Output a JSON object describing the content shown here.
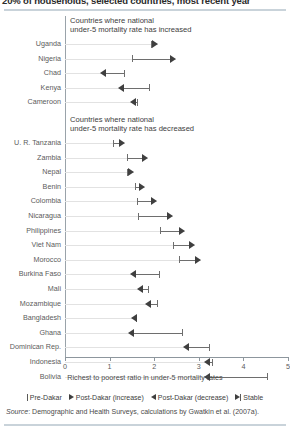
{
  "figure": {
    "title": "20% of households, selected countries, most recent year",
    "x_axis_title": "Richest to poorest ratio in under-5 mortality rates",
    "source_prefix": "Source",
    "source_text": ": Demographic and Health Surveys, calculations by Gwatkin et al. (2007a)."
  },
  "legend": {
    "items": [
      {
        "label": "Pre-Dakar",
        "marker": "vertical-bar"
      },
      {
        "label": "Post-Dakar (increase)",
        "marker": "arrow-right"
      },
      {
        "label": "Post-Dakar (decrease)",
        "marker": "arrow-left"
      },
      {
        "label": "Stable",
        "marker": "arrow-bar"
      }
    ]
  },
  "chart_data": {
    "type": "bar",
    "title": "20% of households, selected countries, most recent year",
    "xlabel": "Richest to poorest ratio in under-5 mortality rates",
    "ylabel": "",
    "xlim": [
      0,
      5
    ],
    "xticks": [
      0,
      1,
      2,
      3,
      4,
      5
    ],
    "grid": false,
    "orientation": "horizontal",
    "legend_position": "bottom",
    "panels": [
      {
        "header": "Countries where national\nunder-5 mortality rate has increased",
        "header_line1": "Countries where national",
        "header_line2": "under-5 mortality rate has increased",
        "rows": [
          {
            "country": "Uganda",
            "pre": 1.92,
            "post": 2.08,
            "direction": "increase"
          },
          {
            "country": "Nigeria",
            "pre": 1.5,
            "post": 2.48,
            "direction": "increase"
          },
          {
            "country": "Chad",
            "pre": 1.32,
            "post": 0.78,
            "direction": "decrease"
          },
          {
            "country": "Kenya",
            "pre": 1.88,
            "post": 1.18,
            "direction": "decrease"
          },
          {
            "country": "Cameroon",
            "pre": 1.62,
            "post": 1.46,
            "direction": "decrease"
          }
        ]
      },
      {
        "header": "Countries where national\nunder-5 mortality rate has decreased",
        "header_line1": "Countries where national",
        "header_line2": "under-5 mortality rate has decreased",
        "rows": [
          {
            "country": "U. R. Tanzania",
            "pre": 1.07,
            "post": 1.34,
            "direction": "increase"
          },
          {
            "country": "Zambia",
            "pre": 1.4,
            "post": 1.86,
            "direction": "increase"
          },
          {
            "country": "Nepal",
            "pre": 1.38,
            "post": 1.55,
            "direction": "increase"
          },
          {
            "country": "Benin",
            "pre": 1.56,
            "post": 1.8,
            "direction": "increase"
          },
          {
            "country": "Colombia",
            "pre": 1.62,
            "post": 2.06,
            "direction": "increase"
          },
          {
            "country": "Nicaragua",
            "pre": 1.64,
            "post": 2.42,
            "direction": "increase"
          },
          {
            "country": "Philippines",
            "pre": 2.12,
            "post": 2.68,
            "direction": "increase"
          },
          {
            "country": "Viet Nam",
            "pre": 2.42,
            "post": 2.92,
            "direction": "increase"
          },
          {
            "country": "Morocco",
            "pre": 2.56,
            "post": 3.04,
            "direction": "increase"
          },
          {
            "country": "Burkina Faso",
            "pre": 2.1,
            "post": 1.46,
            "direction": "decrease"
          },
          {
            "country": "Mali",
            "pre": 1.86,
            "post": 1.62,
            "direction": "decrease"
          },
          {
            "country": "Mozambique",
            "pre": 2.06,
            "post": 1.8,
            "direction": "decrease"
          },
          {
            "country": "Bangladesh",
            "pre": 1.6,
            "post": 1.48,
            "direction": "decrease"
          },
          {
            "country": "Ghana",
            "pre": 2.62,
            "post": 1.42,
            "direction": "decrease"
          },
          {
            "country": "Dominican Rep.",
            "pre": 3.22,
            "post": 2.64,
            "direction": "decrease"
          },
          {
            "country": "Indonesia",
            "pre": 3.3,
            "post": 3.12,
            "direction": "decrease"
          },
          {
            "country": "Bolivia",
            "pre": 4.54,
            "post": 3.12,
            "direction": "decrease"
          }
        ]
      }
    ]
  }
}
